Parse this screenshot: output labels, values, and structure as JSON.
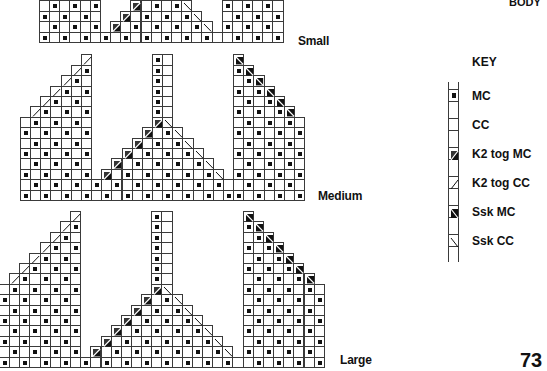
{
  "header": {
    "text": "BODY"
  },
  "page_number": "73",
  "key": {
    "title": "KEY",
    "items": [
      {
        "symbol": "mc",
        "label": "MC"
      },
      {
        "symbol": "cc",
        "label": "CC"
      },
      {
        "symbol": "k2tog-mc",
        "label": "K2 tog MC"
      },
      {
        "symbol": "k2tog-cc",
        "label": "K2 tog CC"
      },
      {
        "symbol": "ssk-mc",
        "label": "Ssk MC"
      },
      {
        "symbol": "ssk-cc",
        "label": "Ssk CC"
      }
    ]
  },
  "charts": [
    {
      "name": "Small",
      "label": "Small",
      "x": 39,
      "bottom": 42,
      "cols": 24,
      "rows": 5,
      "left_block": {
        "from": 0,
        "to": 5,
        "base_height": 5
      },
      "center": {
        "k2tog_start_col": 6,
        "ssk_start_col": 17,
        "base_rows": 1,
        "tri_rows": 3,
        "pillar_cols": [],
        "pillar_top": 0
      },
      "right_block": {
        "from": 18,
        "to": 23,
        "base_height": 5
      },
      "label_pos": {
        "x": 298,
        "y": 34
      }
    },
    {
      "name": "Medium",
      "label": "Medium",
      "x": 20,
      "bottom": 200,
      "cols": 28,
      "rows": 14,
      "left_block": {
        "from": 0,
        "to": 6,
        "base_height": 8
      },
      "center": {
        "k2tog_start_col": 7,
        "ssk_start_col": 20,
        "base_rows": 2,
        "tri_rows": 6,
        "pillar_cols": [
          13,
          14
        ],
        "pillar_top": 13
      },
      "right_block": {
        "from": 21,
        "to": 27,
        "base_height": 8
      },
      "label_pos": {
        "x": 318,
        "y": 189
      }
    },
    {
      "name": "Large",
      "label": "Large",
      "x": -1,
      "bottom": 367,
      "cols": 32,
      "rows": 15,
      "left_block": {
        "from": 0,
        "to": 7,
        "base_height": 8
      },
      "center": {
        "k2tog_start_col": 8,
        "ssk_start_col": 23,
        "base_rows": 1,
        "tri_rows": 7,
        "pillar_cols": [
          15,
          16
        ],
        "pillar_top": 14
      },
      "right_block": {
        "from": 24,
        "to": 31,
        "base_height": 8
      },
      "label_pos": {
        "x": 340,
        "y": 353
      }
    }
  ],
  "colors": {
    "grid": "#3a3a3a",
    "stitch": "#111111",
    "background": "#ffffff"
  }
}
